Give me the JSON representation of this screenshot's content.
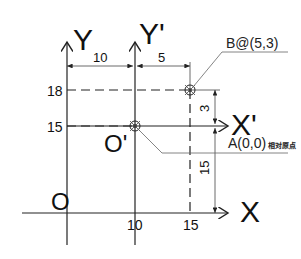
{
  "axes": {
    "y_label": "Y",
    "y_prime_label": "Y'",
    "x_label": "X",
    "x_prime_label": "X'",
    "origin_label": "O",
    "origin_prime_label": "O'"
  },
  "ticks": {
    "x": [
      "10",
      "15"
    ],
    "y": [
      "18",
      "15"
    ]
  },
  "dimensions": {
    "horizontal": [
      "10",
      "5"
    ],
    "vertical": [
      "3",
      "15"
    ]
  },
  "points": {
    "b_label": "B@(5,3)",
    "a_label": "A(0,0)",
    "a_note": "相对原点"
  },
  "colors": {
    "line": "#222222",
    "background": "#ffffff"
  }
}
